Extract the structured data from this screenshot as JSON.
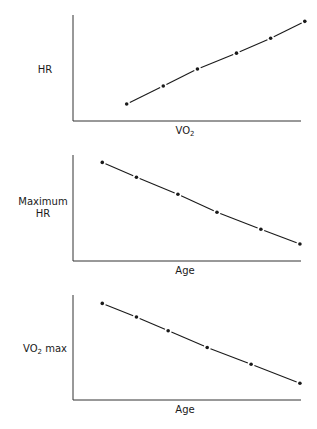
{
  "chart_data": [
    {
      "type": "line",
      "title": "",
      "xlabel": "VO2",
      "xlabel_main": "VO",
      "xlabel_sub": "2",
      "ylabel": "HR",
      "grid": false,
      "markers": true,
      "note": "No tick labels shown; values are relative positions (0-100) read from pixel coordinates.",
      "x": [
        22,
        37,
        51,
        67,
        81,
        95
      ],
      "values": [
        16,
        33,
        49,
        64,
        78,
        94
      ],
      "xlim": [
        0,
        100
      ],
      "ylim": [
        0,
        100
      ]
    },
    {
      "type": "line",
      "title": "",
      "xlabel": "Age",
      "ylabel": "Maximum HR",
      "ylabel_line1": "Maximum",
      "ylabel_line2": "HR",
      "grid": false,
      "markers": true,
      "note": "No tick labels shown; values are relative positions (0-100).",
      "x": [
        12,
        26,
        43,
        59,
        77,
        93
      ],
      "values": [
        93,
        79,
        63,
        46,
        30,
        16
      ],
      "xlim": [
        0,
        100
      ],
      "ylim": [
        0,
        100
      ]
    },
    {
      "type": "line",
      "title": "",
      "xlabel": "Age",
      "ylabel": "VO2 max",
      "ylabel_main": "VO",
      "ylabel_sub": "2",
      "ylabel_tail": " max",
      "grid": false,
      "markers": true,
      "note": "No tick labels shown; values are relative positions (0-100).",
      "x": [
        12,
        26,
        39,
        55,
        73,
        93
      ],
      "values": [
        92,
        79,
        66,
        50,
        34,
        16
      ],
      "xlim": [
        0,
        100
      ],
      "ylim": [
        0,
        100
      ]
    }
  ],
  "style": {
    "line_color": "#1a1a1a",
    "axis_color": "#333333",
    "background": "#ffffff"
  }
}
